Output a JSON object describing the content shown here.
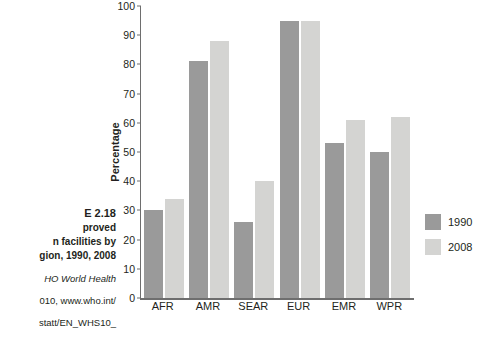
{
  "caption": {
    "title": "E 2.18",
    "sub_line1": "proved",
    "sub_line2": "n facilities by",
    "sub_line3": "gion, 1990, 2008",
    "source_line1": "HO World Health",
    "source_line2": "010, www.who.int/",
    "source_line3": "statt/EN_WHS10_"
  },
  "chart_data": {
    "type": "bar",
    "title": "",
    "xlabel": "",
    "ylabel": "Percentage",
    "categories": [
      "AFR",
      "AMR",
      "SEAR",
      "EUR",
      "EMR",
      "WPR"
    ],
    "series": [
      {
        "name": "1990",
        "color": "#9a9a9a",
        "values": [
          30,
          81,
          26,
          95,
          53,
          50
        ]
      },
      {
        "name": "2008",
        "color": "#d4d4d2",
        "values": [
          34,
          88,
          40,
          95,
          61,
          62
        ]
      }
    ],
    "ylim": [
      0,
      100
    ],
    "yticks": [
      0,
      10,
      20,
      30,
      40,
      50,
      60,
      70,
      80,
      90,
      100
    ],
    "ytick_labels": [
      "0",
      "10",
      "20",
      "30",
      "40",
      "50",
      "60",
      "70",
      "80",
      "90",
      "100"
    ],
    "grid": false,
    "legend_position": "right"
  }
}
